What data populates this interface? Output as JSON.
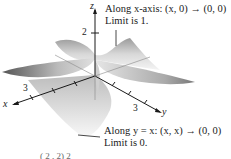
{
  "figure": {
    "axes": {
      "x_label": "x",
      "y_label": "y",
      "z_label": "z",
      "x_tick": "3",
      "y_tick": "3",
      "z_tick": "2"
    },
    "annotations": [
      {
        "line1": "Along x-axis:  (x, 0) → (0, 0)",
        "line2": "Limit is 1."
      },
      {
        "line1": "Along y = x:  (x, x) → (0, 0)",
        "line2": "Limit is 0."
      }
    ],
    "caption_fragment": "( 2  ,  2) 2"
  }
}
